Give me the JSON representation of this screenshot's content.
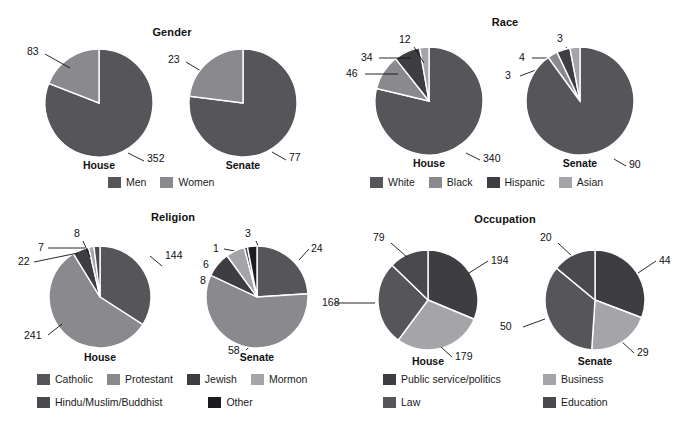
{
  "palette": {
    "c1": "#56565a",
    "c2": "#8a8a8e",
    "c3": "#3e3e42",
    "c4": "#a5a5a9",
    "c5": "#4a4a4e",
    "c6": "#1c1c20",
    "stroke": "#ffffff",
    "text": "#111111"
  },
  "panels": {
    "gender": {
      "title": "Gender",
      "legend": [
        "Men",
        "Women"
      ],
      "house": {
        "caption": "House",
        "labels": [
          "83",
          "352"
        ]
      },
      "senate": {
        "caption": "Senate",
        "labels": [
          "23",
          "77"
        ]
      }
    },
    "race": {
      "title": "Race",
      "legend": [
        "White",
        "Black",
        "Hispanic",
        "Asian"
      ],
      "house": {
        "caption": "House",
        "labels": [
          "12",
          "34",
          "46",
          "340"
        ]
      },
      "senate": {
        "caption": "Senate",
        "labels": [
          "3",
          "4",
          "3",
          "90"
        ]
      }
    },
    "religion": {
      "title": "Religion",
      "legend": [
        "Catholic",
        "Protestant",
        "Jewish",
        "Mormon",
        "Hindu/Muslim/Buddhist",
        "Other"
      ],
      "house": {
        "caption": "House",
        "labels": [
          "8",
          "7",
          "22",
          "144",
          "241"
        ]
      },
      "senate": {
        "caption": "Senate",
        "labels": [
          "3",
          "1",
          "6",
          "8",
          "24",
          "58",
          "168"
        ]
      }
    },
    "occupation": {
      "title": "Occupation",
      "legend": [
        "Public service/politics",
        "Business",
        "Law",
        "Education"
      ],
      "house": {
        "caption": "House",
        "labels": [
          "79",
          "194",
          "168",
          "179"
        ]
      },
      "senate": {
        "caption": "Senate",
        "labels": [
          "20",
          "44",
          "50",
          "29"
        ]
      }
    }
  },
  "chart_data": [
    {
      "type": "pie",
      "title": "Gender",
      "subject": "House",
      "categories": [
        "Men",
        "Women"
      ],
      "values": [
        352,
        83
      ],
      "legend_position": "bottom"
    },
    {
      "type": "pie",
      "title": "Gender",
      "subject": "Senate",
      "categories": [
        "Men",
        "Women"
      ],
      "values": [
        77,
        23
      ],
      "legend_position": "bottom"
    },
    {
      "type": "pie",
      "title": "Race",
      "subject": "House",
      "categories": [
        "White",
        "Black",
        "Hispanic",
        "Asian"
      ],
      "values": [
        340,
        46,
        34,
        12
      ],
      "legend_position": "bottom"
    },
    {
      "type": "pie",
      "title": "Race",
      "subject": "Senate",
      "categories": [
        "White",
        "Black",
        "Hispanic",
        "Asian"
      ],
      "values": [
        90,
        3,
        4,
        3
      ],
      "legend_position": "bottom"
    },
    {
      "type": "pie",
      "title": "Religion",
      "subject": "House",
      "categories": [
        "Catholic",
        "Protestant",
        "Jewish",
        "Mormon",
        "Hindu/Muslim/Buddhist",
        "Other"
      ],
      "values": [
        144,
        241,
        22,
        7,
        8,
        0
      ],
      "legend_position": "bottom"
    },
    {
      "type": "pie",
      "title": "Religion",
      "subject": "Senate",
      "categories": [
        "Catholic",
        "Protestant",
        "Jewish",
        "Mormon",
        "Hindu/Muslim/Buddhist",
        "Other"
      ],
      "values": [
        24,
        58,
        8,
        6,
        1,
        3
      ],
      "legend_position": "bottom"
    },
    {
      "type": "pie",
      "title": "Occupation",
      "subject": "House",
      "categories": [
        "Public service/politics",
        "Business",
        "Law",
        "Education"
      ],
      "values": [
        194,
        179,
        168,
        79
      ],
      "legend_position": "bottom"
    },
    {
      "type": "pie",
      "title": "Occupation",
      "subject": "Senate",
      "categories": [
        "Public service/politics",
        "Business",
        "Law",
        "Education"
      ],
      "values": [
        44,
        29,
        50,
        20
      ],
      "legend_position": "bottom"
    }
  ]
}
